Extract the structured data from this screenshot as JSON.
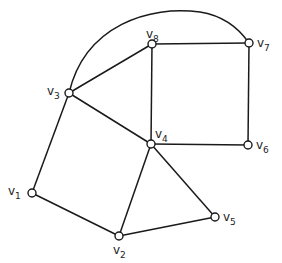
{
  "diagram": {
    "type": "undirected-graph",
    "vertices": [
      {
        "id": "v1",
        "name": "v",
        "sub": "1",
        "x": 32,
        "y": 193,
        "label_dx": -24,
        "label_dy": 2
      },
      {
        "id": "v2",
        "name": "v",
        "sub": "2",
        "x": 119,
        "y": 236,
        "label_dx": -6,
        "label_dy": 18
      },
      {
        "id": "v3",
        "name": "v",
        "sub": "3",
        "x": 69,
        "y": 93,
        "label_dx": -22,
        "label_dy": 2
      },
      {
        "id": "v4",
        "name": "v",
        "sub": "4",
        "x": 151,
        "y": 144,
        "label_dx": 4,
        "label_dy": -6
      },
      {
        "id": "v5",
        "name": "v",
        "sub": "5",
        "x": 215,
        "y": 217,
        "label_dx": 8,
        "label_dy": 4
      },
      {
        "id": "v6",
        "name": "v",
        "sub": "6",
        "x": 248,
        "y": 145,
        "label_dx": 8,
        "label_dy": 4
      },
      {
        "id": "v7",
        "name": "v",
        "sub": "7",
        "x": 249,
        "y": 43,
        "label_dx": 8,
        "label_dy": 4
      },
      {
        "id": "v8",
        "name": "v",
        "sub": "8",
        "x": 152,
        "y": 44,
        "label_dx": -6,
        "label_dy": -6
      }
    ],
    "edges": [
      {
        "from": "v1",
        "to": "v3"
      },
      {
        "from": "v1",
        "to": "v2"
      },
      {
        "from": "v2",
        "to": "v4"
      },
      {
        "from": "v2",
        "to": "v5"
      },
      {
        "from": "v3",
        "to": "v4"
      },
      {
        "from": "v3",
        "to": "v8"
      },
      {
        "from": "v4",
        "to": "v5"
      },
      {
        "from": "v4",
        "to": "v6"
      },
      {
        "from": "v4",
        "to": "v8"
      },
      {
        "from": "v8",
        "to": "v7"
      },
      {
        "from": "v7",
        "to": "v6"
      },
      {
        "from": "v3",
        "to": "v7",
        "curved": true,
        "path": "M69,93 C85,25 150,5 200,12 C225,16 240,30 249,43"
      }
    ],
    "colors": {
      "stroke": "#1a1a1a",
      "vertex_fill": "#ffffff",
      "background": "#ffffff"
    }
  }
}
